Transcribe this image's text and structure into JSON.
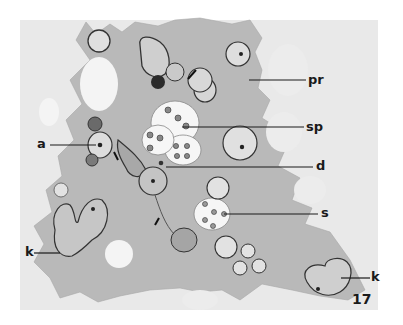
{
  "figure": {
    "number": "17",
    "type": "micrograph-illustration",
    "colors": {
      "background": "#ffffff",
      "plate": "#e9e9e9",
      "cytoplasm": "#b9b9b9",
      "vacuole": "#f4f4f4",
      "ink": "#1a1a1a"
    },
    "labels": [
      {
        "id": "pr",
        "text": "pr"
      },
      {
        "id": "sp",
        "text": "sp"
      },
      {
        "id": "a",
        "text": "a"
      },
      {
        "id": "d",
        "text": "d"
      },
      {
        "id": "s",
        "text": "s"
      },
      {
        "id": "k_left",
        "text": "k"
      },
      {
        "id": "k_right",
        "text": "k"
      }
    ]
  }
}
